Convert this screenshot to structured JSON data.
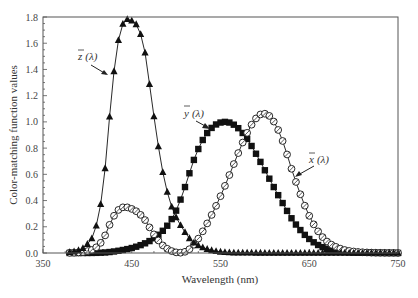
{
  "chart_data": {
    "type": "line",
    "title": "",
    "xlabel": "Wavelength (nm)",
    "ylabel": "Color-matching function values",
    "xlim": [
      350,
      750
    ],
    "ylim": [
      0.0,
      1.8
    ],
    "xticks": [
      350,
      450,
      550,
      650,
      750
    ],
    "xtick_labels": [
      "350",
      "450",
      "550",
      "650",
      "750"
    ],
    "yticks": [
      0.0,
      0.2,
      0.4,
      0.6,
      0.8,
      1.0,
      1.2,
      1.4,
      1.6,
      1.8
    ],
    "ytick_labels": [
      "0.0",
      "0.2",
      "0.4",
      "0.6",
      "0.8",
      "1.0",
      "1.2",
      "1.4",
      "1.6",
      "1.8"
    ],
    "grid": false,
    "legend": "none (inline annotations with arrows)",
    "x": [
      380,
      385,
      390,
      395,
      400,
      405,
      410,
      415,
      420,
      425,
      430,
      435,
      440,
      445,
      450,
      455,
      460,
      465,
      470,
      475,
      480,
      485,
      490,
      495,
      500,
      505,
      510,
      515,
      520,
      525,
      530,
      535,
      540,
      545,
      550,
      555,
      560,
      565,
      570,
      575,
      580,
      585,
      590,
      595,
      600,
      605,
      610,
      615,
      620,
      625,
      630,
      635,
      640,
      645,
      650,
      655,
      660,
      665,
      670,
      675,
      680,
      685,
      690,
      695,
      700,
      705,
      710,
      715,
      720,
      725,
      730,
      735,
      740,
      745,
      750
    ],
    "series": [
      {
        "name": "x̄(λ)",
        "marker": "open-circle",
        "values": [
          0.0014,
          0.0022,
          0.0042,
          0.0076,
          0.0143,
          0.0232,
          0.0435,
          0.0776,
          0.1344,
          0.2148,
          0.2839,
          0.3285,
          0.3483,
          0.3481,
          0.3362,
          0.3187,
          0.2908,
          0.2511,
          0.1954,
          0.1421,
          0.0956,
          0.058,
          0.032,
          0.0147,
          0.0049,
          0.0024,
          0.0093,
          0.0291,
          0.0633,
          0.1096,
          0.1655,
          0.2257,
          0.2904,
          0.3597,
          0.4334,
          0.5121,
          0.5945,
          0.6784,
          0.7621,
          0.8425,
          0.9163,
          0.9786,
          1.0263,
          1.0567,
          1.0622,
          1.0456,
          1.0026,
          0.9384,
          0.8544,
          0.7514,
          0.6424,
          0.5419,
          0.4479,
          0.3608,
          0.2835,
          0.2187,
          0.1649,
          0.1212,
          0.0874,
          0.0636,
          0.0468,
          0.0329,
          0.0227,
          0.0158,
          0.0114,
          0.0081,
          0.0058,
          0.0041,
          0.0029,
          0.002,
          0.0014,
          0.001,
          0.0007,
          0.0005,
          0.0003
        ]
      },
      {
        "name": "ȳ(λ)",
        "marker": "filled-square",
        "values": [
          0.0,
          0.0001,
          0.0001,
          0.0002,
          0.0004,
          0.0006,
          0.0012,
          0.0022,
          0.004,
          0.0073,
          0.0116,
          0.0168,
          0.023,
          0.0298,
          0.038,
          0.048,
          0.06,
          0.0739,
          0.091,
          0.1126,
          0.139,
          0.1693,
          0.208,
          0.2586,
          0.323,
          0.4073,
          0.503,
          0.6082,
          0.71,
          0.7932,
          0.862,
          0.9149,
          0.954,
          0.9803,
          0.995,
          1.0,
          0.995,
          0.9786,
          0.952,
          0.9154,
          0.87,
          0.8163,
          0.757,
          0.6949,
          0.631,
          0.5668,
          0.503,
          0.4412,
          0.381,
          0.321,
          0.265,
          0.217,
          0.175,
          0.1382,
          0.107,
          0.0816,
          0.061,
          0.0446,
          0.032,
          0.0232,
          0.017,
          0.0119,
          0.0082,
          0.0057,
          0.0041,
          0.0029,
          0.0021,
          0.0015,
          0.001,
          0.0007,
          0.0005,
          0.0004,
          0.0002,
          0.0002,
          0.0001
        ]
      },
      {
        "name": "z̄(λ)",
        "marker": "filled-triangle",
        "values": [
          0.0065,
          0.0105,
          0.0201,
          0.0362,
          0.0679,
          0.1102,
          0.2074,
          0.3713,
          0.6456,
          1.0391,
          1.3856,
          1.623,
          1.7471,
          1.7826,
          1.7721,
          1.7441,
          1.6692,
          1.5281,
          1.2876,
          1.0419,
          0.813,
          0.6162,
          0.4652,
          0.3533,
          0.272,
          0.2123,
          0.1582,
          0.1117,
          0.0782,
          0.0573,
          0.0422,
          0.0298,
          0.0203,
          0.0134,
          0.0087,
          0.0057,
          0.0039,
          0.0027,
          0.0021,
          0.0018,
          0.0017,
          0.0014,
          0.0011,
          0.001,
          0.0008,
          0.0006,
          0.0003,
          0.0002,
          0.0002,
          0.0001,
          0.0,
          0.0,
          0.0,
          0.0,
          0.0,
          0.0,
          0.0,
          0.0,
          0.0,
          0.0,
          0.0,
          0.0,
          0.0,
          0.0,
          0.0,
          0.0,
          0.0,
          0.0,
          0.0,
          0.0,
          0.0,
          0.0,
          0.0,
          0.0,
          0.0
        ]
      }
    ],
    "annotations": [
      {
        "text": "z̄ (λ)",
        "points_to": "z̄ curve near 420 nm, ~1.3"
      },
      {
        "text": "ȳ (λ)",
        "points_to": "ȳ curve near 530 nm, ~0.86"
      },
      {
        "text": "x̄ (λ)",
        "points_to": "x̄ curve near 630 nm, ~0.64"
      }
    ]
  },
  "labels": {
    "z_label": "z",
    "y_label": "y",
    "x_label": "x",
    "lambda": "(λ)"
  },
  "style": {
    "frame_color": "#555555",
    "series_color": "#111111"
  }
}
